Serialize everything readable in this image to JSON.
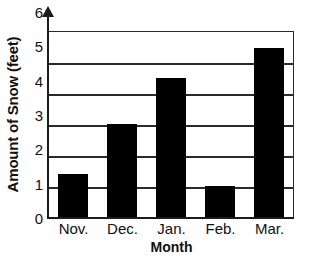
{
  "chart_data": {
    "type": "bar",
    "title": "",
    "xlabel": "Month",
    "ylabel": "Amount of Snow (feet)",
    "categories": [
      "Nov.",
      "Dec.",
      "Jan.",
      "Feb.",
      "Mar."
    ],
    "values": [
      1.4,
      3.0,
      4.5,
      1.0,
      5.45
    ],
    "ylim": [
      0,
      6
    ],
    "ytick_labels": [
      "0",
      "1",
      "2",
      "3",
      "4",
      "5",
      "6"
    ],
    "ytick_values": [
      0,
      1,
      2,
      3,
      4,
      5,
      6
    ],
    "grid": "horizontal",
    "legend": "none",
    "bar_color": "#000000",
    "axis_color": "#1c1c1c",
    "grid_color": "#2a2a2a",
    "background_color": "#ffffff",
    "y_axis_arrow": true
  }
}
